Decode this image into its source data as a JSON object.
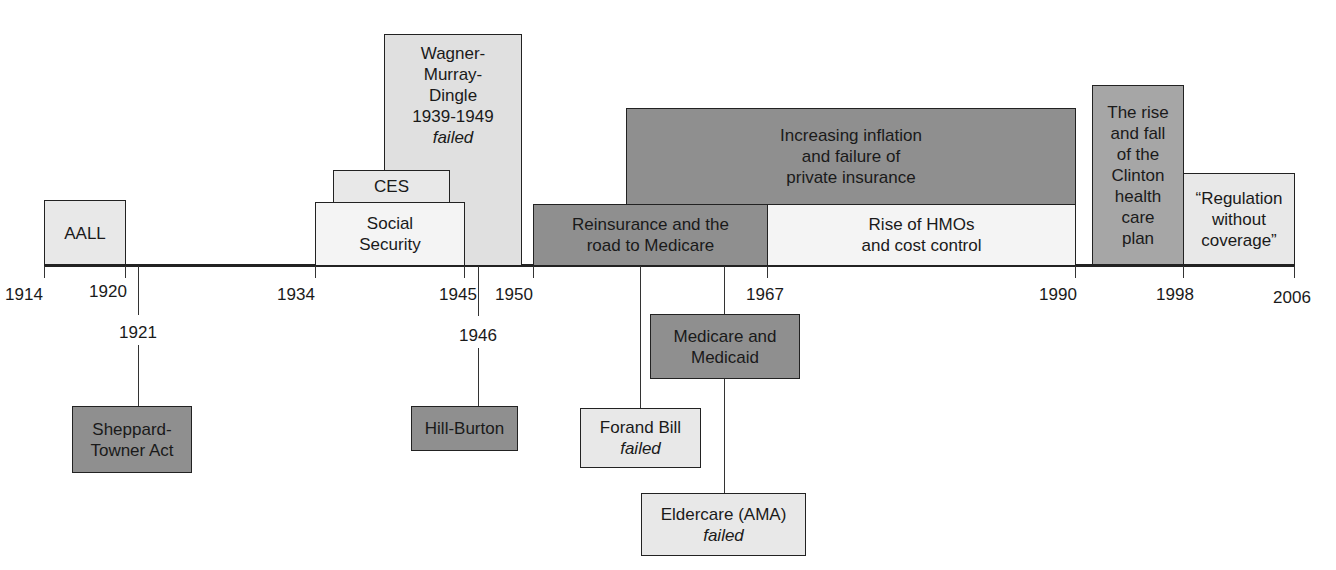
{
  "axis": {
    "ticks": [
      {
        "year": "1914",
        "x": 44
      },
      {
        "year": "1920",
        "x": 125
      },
      {
        "year": "1934",
        "x": 315
      },
      {
        "year": "1945",
        "x": 464
      },
      {
        "year": "1950",
        "x": 533
      },
      {
        "year": "1967",
        "x": 767
      },
      {
        "year": "1990",
        "x": 1075
      },
      {
        "year": "1998",
        "x": 1183
      },
      {
        "year": "2006",
        "x": 1294
      }
    ]
  },
  "above": {
    "aall": {
      "lines": [
        "AALL"
      ]
    },
    "ces": {
      "lines": [
        "CES"
      ]
    },
    "social_security": {
      "lines": [
        "Social",
        "Security"
      ]
    },
    "wagner": {
      "lines": [
        "Wagner-",
        "Murray-",
        "Dingle",
        "1939-1949"
      ],
      "status": "failed"
    },
    "reinsurance": {
      "lines": [
        "Reinsurance and the",
        "road to Medicare"
      ]
    },
    "inflation": {
      "lines": [
        "Increasing inflation",
        "and failure of",
        "private insurance"
      ]
    },
    "hmos": {
      "lines": [
        "Rise of HMOs",
        "and cost control"
      ]
    },
    "clinton": {
      "lines": [
        "The rise",
        "and fall",
        "of the",
        "Clinton",
        "health",
        "care",
        "plan"
      ]
    },
    "regulation": {
      "lines": [
        "“Regulation",
        "without",
        "coverage”"
      ]
    }
  },
  "below": {
    "sheppard": {
      "year": "1921",
      "lines": [
        "Sheppard-",
        "Towner Act"
      ]
    },
    "hill_burton": {
      "year": "1946",
      "lines": [
        "Hill-Burton"
      ]
    },
    "forand": {
      "lines": [
        "Forand Bill"
      ],
      "status": "failed"
    },
    "medicare": {
      "lines": [
        "Medicare and",
        "Medicaid"
      ]
    },
    "eldercare": {
      "lines": [
        "Eldercare (AMA)"
      ],
      "status": "failed"
    }
  },
  "colors": {
    "dark": "#8f8f8f",
    "mid": "#cfcfcf",
    "light": "#e8e8e8",
    "lighter": "#f4f4f4",
    "line": "#222222"
  }
}
